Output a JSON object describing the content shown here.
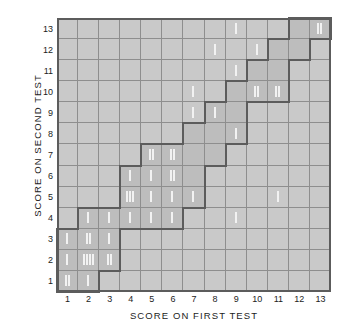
{
  "chart_data": {
    "type": "heatmap",
    "title": "",
    "xlabel": "SCORE ON FIRST TEST",
    "ylabel": "SCORE ON SECOND TEST",
    "x_tick_labels": [
      "1",
      "2",
      "3",
      "4",
      "5",
      "6",
      "7",
      "8",
      "9",
      "10",
      "11",
      "12",
      "13"
    ],
    "y_tick_labels": [
      "1",
      "2",
      "3",
      "4",
      "5",
      "6",
      "7",
      "8",
      "9",
      "10",
      "11",
      "12",
      "13"
    ],
    "xlim": [
      0.5,
      13.5
    ],
    "ylim": [
      0.5,
      13.5
    ],
    "grid": true,
    "legend": "none",
    "cell_marker": "tally-mark",
    "counts": [
      {
        "x": 1,
        "y": 1,
        "count": 2
      },
      {
        "x": 2,
        "y": 1,
        "count": 1
      },
      {
        "x": 1,
        "y": 2,
        "count": 1
      },
      {
        "x": 2,
        "y": 2,
        "count": 4
      },
      {
        "x": 3,
        "y": 2,
        "count": 2
      },
      {
        "x": 1,
        "y": 3,
        "count": 1
      },
      {
        "x": 2,
        "y": 3,
        "count": 2
      },
      {
        "x": 3,
        "y": 3,
        "count": 1
      },
      {
        "x": 2,
        "y": 4,
        "count": 1
      },
      {
        "x": 3,
        "y": 4,
        "count": 1
      },
      {
        "x": 4,
        "y": 4,
        "count": 1
      },
      {
        "x": 5,
        "y": 4,
        "count": 1
      },
      {
        "x": 6,
        "y": 4,
        "count": 1
      },
      {
        "x": 9,
        "y": 4,
        "count": 1
      },
      {
        "x": 4,
        "y": 5,
        "count": 3
      },
      {
        "x": 5,
        "y": 5,
        "count": 1
      },
      {
        "x": 6,
        "y": 5,
        "count": 1
      },
      {
        "x": 7,
        "y": 5,
        "count": 1
      },
      {
        "x": 11,
        "y": 5,
        "count": 1
      },
      {
        "x": 4,
        "y": 6,
        "count": 1
      },
      {
        "x": 5,
        "y": 6,
        "count": 1
      },
      {
        "x": 6,
        "y": 6,
        "count": 2
      },
      {
        "x": 5,
        "y": 7,
        "count": 2
      },
      {
        "x": 6,
        "y": 7,
        "count": 2
      },
      {
        "x": 9,
        "y": 8,
        "count": 1
      },
      {
        "x": 7,
        "y": 9,
        "count": 1
      },
      {
        "x": 8,
        "y": 9,
        "count": 1
      },
      {
        "x": 7,
        "y": 10,
        "count": 1
      },
      {
        "x": 10,
        "y": 10,
        "count": 2
      },
      {
        "x": 11,
        "y": 10,
        "count": 2
      },
      {
        "x": 9,
        "y": 11,
        "count": 1
      },
      {
        "x": 8,
        "y": 12,
        "count": 1
      },
      {
        "x": 10,
        "y": 12,
        "count": 1
      },
      {
        "x": 9,
        "y": 13,
        "count": 1
      },
      {
        "x": 13,
        "y": 13,
        "count": 2
      }
    ],
    "band_cells": [
      {
        "x": 1,
        "y": 1
      },
      {
        "x": 2,
        "y": 1
      },
      {
        "x": 1,
        "y": 2
      },
      {
        "x": 2,
        "y": 2
      },
      {
        "x": 3,
        "y": 2
      },
      {
        "x": 1,
        "y": 3
      },
      {
        "x": 2,
        "y": 3
      },
      {
        "x": 3,
        "y": 3
      },
      {
        "x": 2,
        "y": 4
      },
      {
        "x": 3,
        "y": 4
      },
      {
        "x": 4,
        "y": 4
      },
      {
        "x": 5,
        "y": 4
      },
      {
        "x": 6,
        "y": 4
      },
      {
        "x": 4,
        "y": 5
      },
      {
        "x": 5,
        "y": 5
      },
      {
        "x": 6,
        "y": 5
      },
      {
        "x": 7,
        "y": 5
      },
      {
        "x": 4,
        "y": 6
      },
      {
        "x": 5,
        "y": 6
      },
      {
        "x": 6,
        "y": 6
      },
      {
        "x": 7,
        "y": 6
      },
      {
        "x": 5,
        "y": 7
      },
      {
        "x": 6,
        "y": 7
      },
      {
        "x": 7,
        "y": 7
      },
      {
        "x": 8,
        "y": 7
      },
      {
        "x": 7,
        "y": 8
      },
      {
        "x": 8,
        "y": 8
      },
      {
        "x": 9,
        "y": 8
      },
      {
        "x": 8,
        "y": 9
      },
      {
        "x": 9,
        "y": 9
      },
      {
        "x": 9,
        "y": 10
      },
      {
        "x": 10,
        "y": 10
      },
      {
        "x": 11,
        "y": 10
      },
      {
        "x": 10,
        "y": 11
      },
      {
        "x": 11,
        "y": 11
      },
      {
        "x": 11,
        "y": 12
      },
      {
        "x": 12,
        "y": 12
      },
      {
        "x": 12,
        "y": 13
      },
      {
        "x": 13,
        "y": 13
      }
    ]
  },
  "colors": {
    "cell_fill": "#c9c9c9",
    "band_fill": "#bdbdbd",
    "grid_line": "#8e8e8e",
    "outline": "#5c5c5c",
    "tally": "#f2f2f2",
    "text": "#1c1c1c",
    "background": "#ffffff"
  }
}
